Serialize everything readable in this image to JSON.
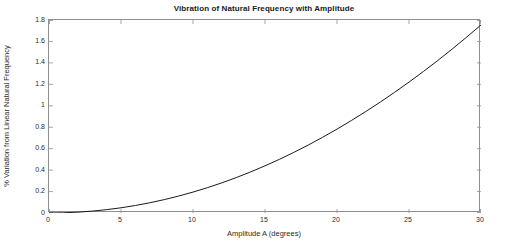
{
  "chart_data": {
    "type": "line",
    "title": "Vibration of Natural Frequency with Amplitude",
    "xlabel": "Amplitude A (degrees)",
    "ylabel": "% Variation from Linear Natural Frequency",
    "xlim": [
      0,
      30
    ],
    "ylim": [
      0,
      1.8
    ],
    "grid": false,
    "legend": null,
    "box": true,
    "tick_direction": "in",
    "line_color": "#1a1a1a",
    "line_width": 1,
    "xticks": [
      0,
      5,
      10,
      15,
      20,
      25,
      30
    ],
    "xticklabels": [
      "0",
      "5",
      "10",
      "15",
      "20",
      "25",
      "30"
    ],
    "yticks": [
      0,
      0.2,
      0.4,
      0.6,
      0.8,
      1.0,
      1.2,
      1.4,
      1.6,
      1.8
    ],
    "yticklabels": [
      "0",
      "0.2",
      "0.4",
      "0.6",
      "0.8",
      "1",
      "1.2",
      "1.4",
      "1.6",
      "1.8"
    ],
    "x": [
      0,
      1,
      2,
      3,
      4,
      5,
      6,
      7,
      8,
      9,
      10,
      11,
      12,
      13,
      14,
      15,
      16,
      17,
      18,
      19,
      20,
      21,
      22,
      23,
      24,
      25,
      26,
      27,
      28,
      29,
      30
    ],
    "y": [
      0,
      0.0019,
      0.0078,
      0.0175,
      0.0311,
      0.0486,
      0.07,
      0.0953,
      0.1246,
      0.1578,
      0.195,
      0.236,
      0.281,
      0.33,
      0.383,
      0.4399,
      0.5004,
      0.565,
      0.6337,
      0.706,
      0.7824,
      0.8626,
      0.9465,
      1.034,
      1.1256,
      1.221,
      1.3199,
      1.4225,
      1.5293,
      1.6399,
      1.7539
    ],
    "series": [
      {
        "name": "% variation",
        "values": [
          0,
          0.0019,
          0.0078,
          0.0175,
          0.0311,
          0.0486,
          0.07,
          0.0953,
          0.1246,
          0.1578,
          0.195,
          0.236,
          0.281,
          0.33,
          0.383,
          0.4399,
          0.5004,
          0.565,
          0.6337,
          0.706,
          0.7824,
          0.8626,
          0.9465,
          1.034,
          1.1256,
          1.221,
          1.3199,
          1.4225,
          1.5293,
          1.6399,
          1.7539
        ]
      }
    ]
  },
  "colors": {
    "axis": "#8f8f8f",
    "text": "#2b2b2b",
    "title": "#1a1a1a",
    "line": "#1a1a1a",
    "background": "#ffffff"
  }
}
